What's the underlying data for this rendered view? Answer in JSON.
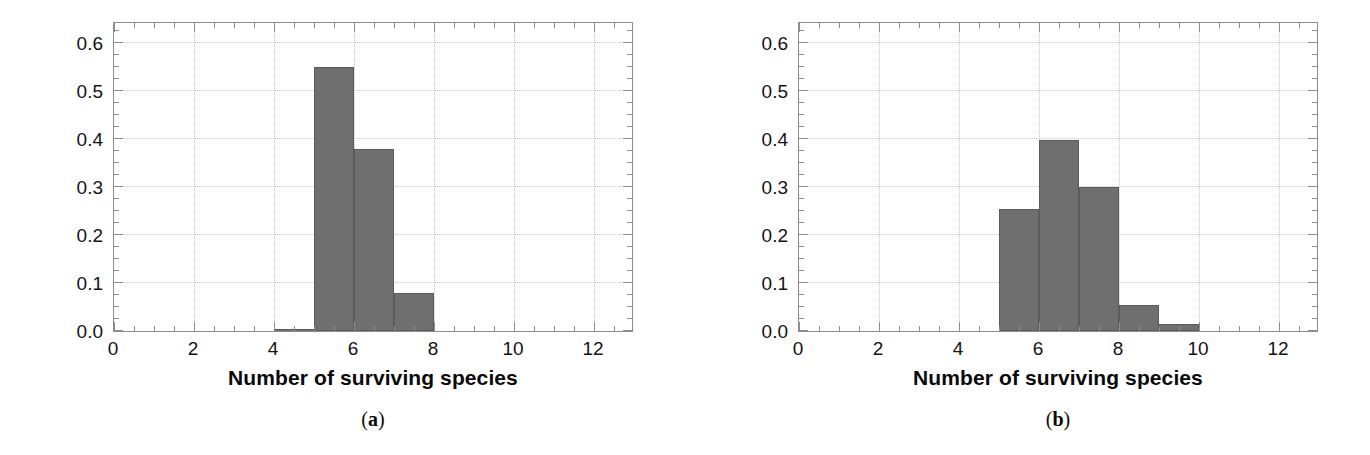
{
  "figure": {
    "background_color": "#ffffff",
    "bar_color": "#6f6f6f",
    "bar_edge_color": "#5b5b5b",
    "axis_color": "#8d8d8d",
    "grid_color": "#c9c9c9",
    "text_color": "#0a0a0a"
  },
  "panels": [
    {
      "caption_open": "(",
      "caption_letter": "a",
      "caption_close": ")",
      "caption": "(a)"
    },
    {
      "caption_open": "(",
      "caption_letter": "b",
      "caption_close": ")",
      "caption": "(b)"
    }
  ],
  "chart_data": [
    {
      "type": "bar",
      "panel": "(a)",
      "title": "",
      "xlabel": "Number of surviving species",
      "ylabel": "Probability",
      "xlim": [
        0,
        13
      ],
      "ylim": [
        0,
        0.645
      ],
      "grid": true,
      "legend": "none",
      "xticks": [
        0,
        2,
        4,
        6,
        8,
        10,
        12
      ],
      "xtick_labels": [
        "0",
        "2",
        "4",
        "6",
        "8",
        "10",
        "12"
      ],
      "xticks_minor_step": 0.5,
      "yticks": [
        0.0,
        0.1,
        0.2,
        0.3,
        0.4,
        0.5,
        0.6
      ],
      "ytick_labels": [
        "0.0",
        "0.1",
        "0.2",
        "0.3",
        "0.4",
        "0.5",
        "0.6"
      ],
      "yticks_minor_step": 0.025,
      "bin_width": 1,
      "bins": [
        {
          "x_left": 4,
          "x_right": 5,
          "value": 0.005
        },
        {
          "x_left": 5,
          "x_right": 6,
          "value": 0.55
        },
        {
          "x_left": 6,
          "x_right": 7,
          "value": 0.378
        },
        {
          "x_left": 7,
          "x_right": 8,
          "value": 0.08
        }
      ],
      "categories": [
        "4-5",
        "5-6",
        "6-7",
        "7-8"
      ],
      "values": [
        0.005,
        0.55,
        0.378,
        0.08
      ]
    },
    {
      "type": "bar",
      "panel": "(b)",
      "title": "",
      "xlabel": "Number of surviving species",
      "ylabel": "Probability",
      "xlim": [
        0,
        13
      ],
      "ylim": [
        0,
        0.645
      ],
      "grid": true,
      "legend": "none",
      "xticks": [
        0,
        2,
        4,
        6,
        8,
        10,
        12
      ],
      "xtick_labels": [
        "0",
        "2",
        "4",
        "6",
        "8",
        "10",
        "12"
      ],
      "xticks_minor_step": 0.5,
      "yticks": [
        0.0,
        0.1,
        0.2,
        0.3,
        0.4,
        0.5,
        0.6
      ],
      "ytick_labels": [
        "0.0",
        "0.1",
        "0.2",
        "0.3",
        "0.4",
        "0.5",
        "0.6"
      ],
      "yticks_minor_step": 0.025,
      "bin_width": 1,
      "bins": [
        {
          "x_left": 5,
          "x_right": 6,
          "value": 0.253
        },
        {
          "x_left": 6,
          "x_right": 7,
          "value": 0.398
        },
        {
          "x_left": 7,
          "x_right": 8,
          "value": 0.3
        },
        {
          "x_left": 8,
          "x_right": 9,
          "value": 0.055
        },
        {
          "x_left": 9,
          "x_right": 10,
          "value": 0.014
        }
      ],
      "categories": [
        "5-6",
        "6-7",
        "7-8",
        "8-9",
        "9-10"
      ],
      "values": [
        0.253,
        0.398,
        0.3,
        0.055,
        0.014
      ]
    }
  ]
}
